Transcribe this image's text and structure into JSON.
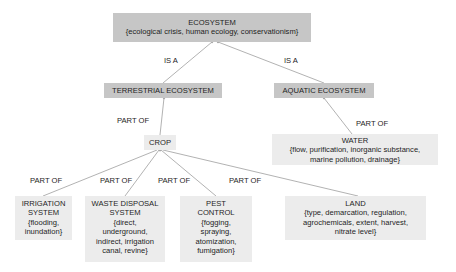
{
  "diagram": {
    "type": "concept-hierarchy",
    "colors": {
      "dark_node": "#c6c6c6",
      "light_node": "#ececec",
      "edge": "#a9a9a9",
      "text": "#1e1e1e"
    },
    "nodes": {
      "ecosystem": {
        "title": "ECOSYSTEM",
        "attrs": "{ecological crisis, human ecology, conservationism}"
      },
      "terrestrial": {
        "title": "TERRESTRIAL ECOSYSTEM"
      },
      "aquatic": {
        "title": "AQUATIC ECOSYSTEM"
      },
      "crop": {
        "title": "CROP"
      },
      "water": {
        "title": "WATER",
        "attrs_line1": "{flow, purification, inorganic substance,",
        "attrs_line2": "marine pollution, drainage}"
      },
      "irrigation": {
        "title_line1": "IRRIGATION",
        "title_line2": "SYSTEM",
        "attrs_line1": "{flooding,",
        "attrs_line2": "inundation}"
      },
      "waste": {
        "title_line1": "WASTE DISPOSAL",
        "title_line2": "SYSTEM",
        "attrs_line1": "{direct,",
        "attrs_line2": "underground,",
        "attrs_line3": "indirect, irrigation",
        "attrs_line4": "canal, revine}"
      },
      "pest": {
        "title_line1": "PEST",
        "title_line2": "CONTROL",
        "attrs_line1": "{fogging,",
        "attrs_line2": "spraying,",
        "attrs_line3": "atomization,",
        "attrs_line4": "fumigation}"
      },
      "land": {
        "title": "LAND",
        "attrs_line1": "{type, demarcation, regulation,",
        "attrs_line2": "agrochemicals, extent, harvest,",
        "attrs_line3": "nitrate level}"
      }
    },
    "edges": [
      {
        "from": "terrestrial",
        "to": "ecosystem",
        "label": "IS A"
      },
      {
        "from": "aquatic",
        "to": "ecosystem",
        "label": "IS A"
      },
      {
        "from": "crop",
        "to": "terrestrial",
        "label": "PART OF"
      },
      {
        "from": "water",
        "to": "aquatic",
        "label": "PART OF"
      },
      {
        "from": "irrigation",
        "to": "crop",
        "label": "PART OF"
      },
      {
        "from": "waste",
        "to": "crop",
        "label": "PART OF"
      },
      {
        "from": "pest",
        "to": "crop",
        "label": "PART OF"
      },
      {
        "from": "land",
        "to": "crop",
        "label": "PART OF"
      }
    ]
  }
}
